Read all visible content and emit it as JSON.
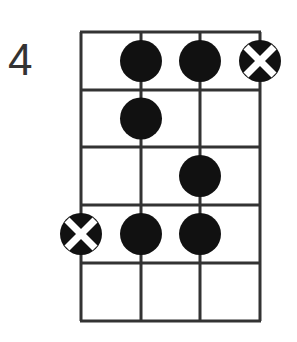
{
  "diagram": {
    "type": "bass-scale-fretboard",
    "start_fret_label": "4",
    "strings": 4,
    "frets": 5,
    "grid": {
      "x": [
        81,
        141,
        200,
        260
      ],
      "y": [
        32,
        90,
        147,
        205,
        263,
        321
      ]
    },
    "notes": [
      {
        "string": 2,
        "fret": 1,
        "type": "dot"
      },
      {
        "string": 3,
        "fret": 1,
        "type": "dot"
      },
      {
        "string": 4,
        "fret": 1,
        "type": "root"
      },
      {
        "string": 2,
        "fret": 2,
        "type": "dot"
      },
      {
        "string": 3,
        "fret": 3,
        "type": "dot"
      },
      {
        "string": 1,
        "fret": 4,
        "type": "root"
      },
      {
        "string": 2,
        "fret": 4,
        "type": "dot"
      },
      {
        "string": 3,
        "fret": 4,
        "type": "dot"
      }
    ],
    "colors": {
      "line": "#333333",
      "dot": "#111111",
      "cross": "#ffffff"
    }
  }
}
